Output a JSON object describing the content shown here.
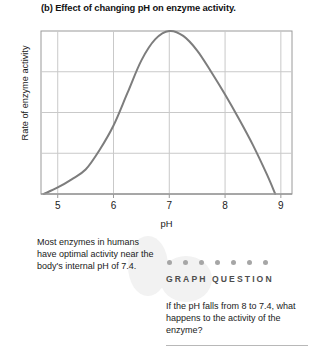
{
  "figure": {
    "title": "(b) Effect of changing pH on enzyme activity."
  },
  "caption": {
    "text": "Most enzymes in humans have optimal activity near the body's internal pH of 7.4."
  },
  "graph_question": {
    "heading": "GRAPH QUESTION",
    "dot_count": 7,
    "dot_color": "#a6a6a6",
    "question": "If the pH falls from 8 to 7.4, what happens to the activity of the enzyme?"
  },
  "chart_data": {
    "type": "line",
    "title": "(b) Effect of changing pH on enzyme activity.",
    "xlabel": "pH",
    "ylabel": "Rate of enzyme activity",
    "xlim": [
      4.7,
      9.2
    ],
    "ylim": [
      0,
      1
    ],
    "xticks": [
      5,
      6,
      7,
      8,
      9
    ],
    "xtick_labels": [
      "5",
      "6",
      "7",
      "8",
      "9"
    ],
    "yticks": [],
    "ytick_labels": [],
    "grid": "both",
    "grid_color": "#c9c9c9",
    "axis_color": "#9a9a9a",
    "line_color": "#7d7d7d",
    "line_width": 2,
    "legend": "none",
    "x": [
      4.75,
      5.0,
      5.25,
      5.5,
      5.75,
      6.0,
      6.25,
      6.5,
      6.75,
      7.0,
      7.25,
      7.5,
      7.75,
      8.0,
      8.25,
      8.5,
      8.75,
      8.9
    ],
    "y": [
      0.0,
      0.04,
      0.09,
      0.15,
      0.27,
      0.42,
      0.62,
      0.82,
      0.95,
      1.0,
      0.97,
      0.88,
      0.75,
      0.61,
      0.46,
      0.3,
      0.12,
      0.0
    ],
    "peak": {
      "x": 7.0,
      "y": 1.0,
      "label": "optimum pH"
    },
    "annotations": []
  }
}
